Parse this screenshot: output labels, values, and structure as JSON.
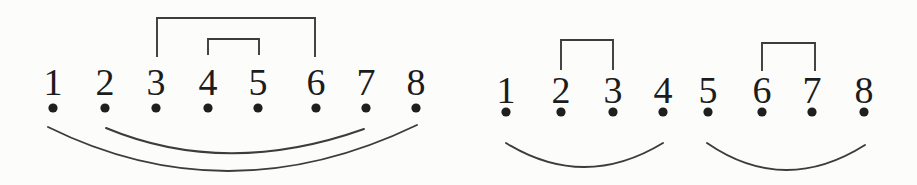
{
  "figure": {
    "background": "#fcfcfb",
    "line_color": "#3c3c3c",
    "dot_color": "#1f1f1f",
    "label_color": "#1c1c1c",
    "line_width": 1.9,
    "diagrams": [
      {
        "id": "left-matching",
        "point_labels": [
          "1",
          "2",
          "3",
          "4",
          "5",
          "6",
          "7",
          "8"
        ],
        "point_x": [
          53,
          105,
          156,
          208,
          258,
          316,
          366,
          416
        ],
        "label_baseline_y": 95,
        "dot_y": 108,
        "dot_radius": 4.6,
        "top_brackets": [
          {
            "from": "3",
            "to": "6",
            "x1": 157,
            "x2": 315,
            "top_y": 18,
            "leg_bottom_y": 57
          },
          {
            "from": "4",
            "to": "5",
            "x1": 208,
            "x2": 259,
            "top_y": 39,
            "leg_bottom_y": 55
          }
        ],
        "bottom_arcs": [
          {
            "from": "1",
            "to": "8",
            "x1": 48,
            "y1": 127,
            "x2": 417,
            "y2": 125,
            "ctrl_x": 228,
            "ctrl_y": 216
          },
          {
            "from": "2",
            "to": "7",
            "x1": 106,
            "y1": 128,
            "x2": 364,
            "y2": 129,
            "ctrl_x": 226,
            "ctrl_y": 178
          }
        ]
      },
      {
        "id": "right-matching",
        "point_labels": [
          "1",
          "2",
          "3",
          "4",
          "5",
          "6",
          "7",
          "8"
        ],
        "point_x": [
          506,
          561,
          613,
          663,
          708,
          762,
          812,
          864
        ],
        "label_baseline_y": 103,
        "dot_y": 112,
        "dot_radius": 4.6,
        "top_brackets": [
          {
            "from": "2",
            "to": "3",
            "x1": 561,
            "x2": 613,
            "top_y": 40,
            "leg_bottom_y": 70
          },
          {
            "from": "6",
            "to": "7",
            "x1": 762,
            "x2": 815,
            "top_y": 43,
            "leg_bottom_y": 71
          }
        ],
        "bottom_arcs": [
          {
            "from": "1",
            "to": "4",
            "x1": 506,
            "y1": 143,
            "x2": 663,
            "y2": 143,
            "ctrl_x": 584,
            "ctrl_y": 191
          },
          {
            "from": "5",
            "to": "8",
            "x1": 707,
            "y1": 143,
            "x2": 865,
            "y2": 145,
            "ctrl_x": 784,
            "ctrl_y": 196
          }
        ]
      }
    ]
  }
}
